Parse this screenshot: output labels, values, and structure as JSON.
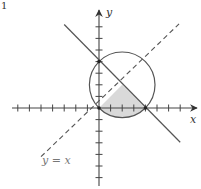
{
  "figure": {
    "number_label": "1",
    "x_axis_label": "x",
    "y_axis_label": "y",
    "line_label": "y = x"
  },
  "geometry": {
    "origin_px": [
      99,
      108
    ],
    "unit_px": 11.6,
    "x_ticks": [
      -7,
      -6,
      -5,
      -4,
      -3,
      -2,
      -1,
      1,
      2,
      3,
      4,
      5,
      6,
      7
    ],
    "y_ticks": [
      -6,
      -5,
      -4,
      -3,
      -2,
      -1,
      1,
      2,
      3,
      4,
      5,
      6,
      7
    ],
    "circle": {
      "center": [
        2,
        2
      ],
      "radius": 2.8284
    },
    "solid_line": {
      "equation": "x + y = 4",
      "from": [
        -3,
        7.2
      ],
      "to": [
        7,
        -2.95
      ]
    },
    "dashed_line": {
      "equation": "y = x",
      "from": [
        -5,
        -4.2
      ],
      "to": [
        6.9,
        7.25
      ]
    },
    "points": [
      [
        0,
        4
      ],
      [
        0,
        0
      ],
      [
        4,
        0
      ]
    ],
    "shaded_region": "bounded by y = x, x + y = 4, and lower circle arc from (4,0) to (0,0)"
  },
  "colors": {
    "stroke": "#555555",
    "axis": "#444444",
    "shade": "#d9d9d9",
    "label_gray": "#777777"
  }
}
